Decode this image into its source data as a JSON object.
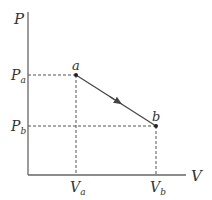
{
  "diagram": {
    "type": "P-V diagram",
    "axes": {
      "y_label": "P",
      "x_label": "V"
    },
    "points": [
      {
        "id": "a",
        "label": "a",
        "p_label": "P",
        "p_sub": "a",
        "v_label": "V",
        "v_sub": "a"
      },
      {
        "id": "b",
        "label": "b",
        "p_label": "P",
        "p_sub": "b",
        "v_label": "V",
        "v_sub": "b"
      }
    ],
    "process": {
      "from": "a",
      "to": "b",
      "direction": "a-to-b",
      "shape": "straight line"
    },
    "colors": {
      "line": "#555555",
      "dashed": "#555555",
      "text": "#333333",
      "background": "#ffffff"
    }
  }
}
